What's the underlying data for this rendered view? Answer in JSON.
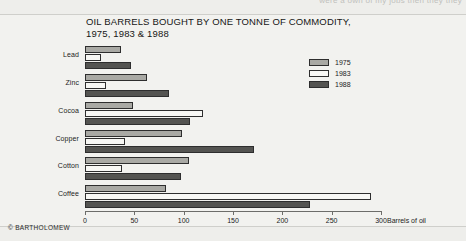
{
  "page": {
    "cut_off_header_text": "were a own of my jobs then they they",
    "credit": "© BARTHOLOMEW"
  },
  "chart_data": {
    "type": "bar",
    "orientation": "horizontal",
    "title": "OIL BARRELS BOUGHT BY ONE TONNE OF COMMODITY,\n1975, 1983 & 1988",
    "xlabel": "Barrels of oil",
    "ylabel": "",
    "xlim": [
      0,
      300
    ],
    "xticks": [
      0,
      50,
      100,
      150,
      200,
      250,
      300
    ],
    "xticklabels": [
      "0",
      "50",
      "100",
      "150",
      "200",
      "250",
      "300"
    ],
    "grid": false,
    "legend_position": "top-right",
    "categories": [
      "Lead",
      "Zinc",
      "Cocoa",
      "Copper",
      "Cotton",
      "Coffee"
    ],
    "series": [
      {
        "name": "1975",
        "color": "#a9a9a4",
        "values": [
          36,
          63,
          49,
          98,
          105,
          82
        ]
      },
      {
        "name": "1983",
        "color": "#f7f7f4",
        "values": [
          16,
          21,
          120,
          41,
          37,
          290
        ]
      },
      {
        "name": "1988",
        "color": "#545451",
        "values": [
          47,
          85,
          106,
          171,
          97,
          228
        ]
      }
    ]
  }
}
